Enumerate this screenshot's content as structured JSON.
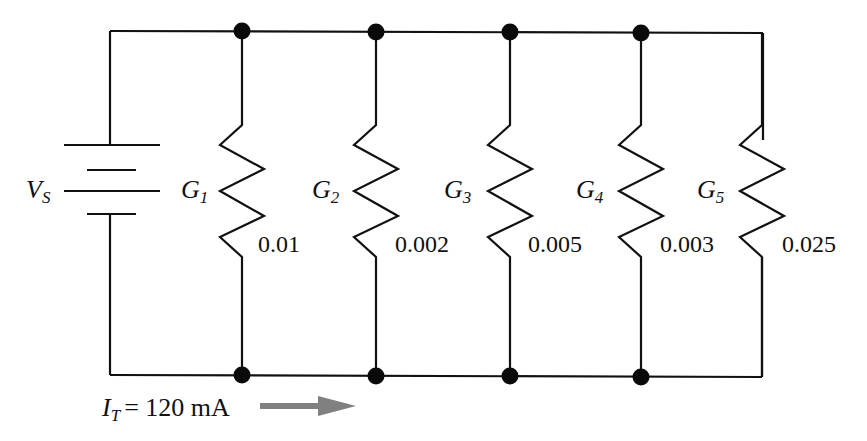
{
  "diagram": {
    "type": "parallel-circuit",
    "source": {
      "label": "V",
      "subscript": "S"
    },
    "resistors": [
      {
        "label": "G",
        "subscript": "1",
        "value": "0.01"
      },
      {
        "label": "G",
        "subscript": "2",
        "value": "0.002"
      },
      {
        "label": "G",
        "subscript": "3",
        "value": "0.005"
      },
      {
        "label": "G",
        "subscript": "4",
        "value": "0.003"
      },
      {
        "label": "G",
        "subscript": "5",
        "value": "0.025"
      }
    ],
    "total_current": {
      "label": "I",
      "subscript": "T",
      "equals": "= 120 mA"
    },
    "colors": {
      "wire": "#111111",
      "node": "#0a0a0a",
      "arrow": "#808080"
    }
  }
}
